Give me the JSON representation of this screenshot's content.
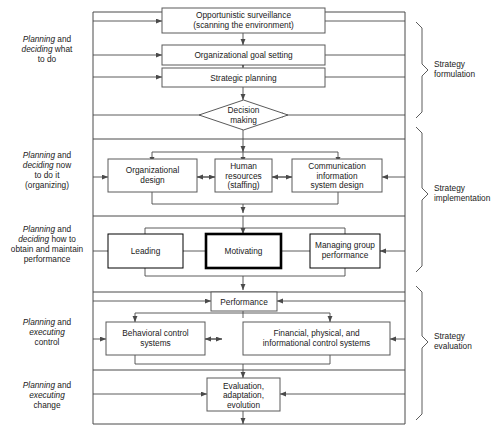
{
  "figure": {
    "background_color": "#ffffff",
    "line_color": "#4a4a4a",
    "box_fill": "#ffffff",
    "emphasis_box": "Motivating"
  },
  "stages": [
    {
      "id": "planning-deciding-what",
      "lines": [
        "Planning and",
        "deciding what",
        "to do"
      ],
      "italic_words": [
        "Planning",
        "deciding"
      ]
    },
    {
      "id": "planning-deciding-now",
      "lines": [
        "Planning and",
        "deciding now",
        "to do it",
        "(organizing)"
      ],
      "italic_words": [
        "Planning",
        "deciding"
      ]
    },
    {
      "id": "planning-deciding-how",
      "lines": [
        "Planning and",
        "deciding how to",
        "obtain and maintain",
        "performance"
      ],
      "italic_words": [
        "Planning",
        "deciding"
      ]
    },
    {
      "id": "planning-executing-control",
      "lines": [
        "Planning and",
        "executing",
        "control"
      ],
      "italic_words": [
        "Planning",
        "executing"
      ]
    },
    {
      "id": "planning-executing-change",
      "lines": [
        "Planning and",
        "executing",
        "change"
      ],
      "italic_words": [
        "Planning",
        "executing"
      ]
    }
  ],
  "nodes": {
    "opportunistic": {
      "lines": [
        "Opportunistic surveillance",
        "(scanning the environment)"
      ],
      "shape": "rect"
    },
    "goal_setting": {
      "lines": [
        "Organizational goal setting"
      ],
      "shape": "rect"
    },
    "strategic_planning": {
      "lines": [
        "Strategic planning"
      ],
      "shape": "rect"
    },
    "decision_making": {
      "lines": [
        "Decision",
        "making"
      ],
      "shape": "diamond"
    },
    "org_design": {
      "lines": [
        "Organizational",
        "design"
      ],
      "shape": "rect"
    },
    "human_resources": {
      "lines": [
        "Human",
        "resources",
        "(staffing)"
      ],
      "shape": "rect"
    },
    "comm_info": {
      "lines": [
        "Communication",
        "information",
        "system design"
      ],
      "shape": "rect"
    },
    "leading": {
      "lines": [
        "Leading"
      ],
      "shape": "rect"
    },
    "motivating": {
      "lines": [
        "Motivating"
      ],
      "shape": "rect",
      "emphasis": true
    },
    "managing_group": {
      "lines": [
        "Managing group",
        "performance"
      ],
      "shape": "rect"
    },
    "performance": {
      "lines": [
        "Performance"
      ],
      "shape": "rect"
    },
    "behavioral_control": {
      "lines": [
        "Behavioral control",
        "systems"
      ],
      "shape": "rect"
    },
    "financial_control": {
      "lines": [
        "Financial, physical, and",
        "informational control systems"
      ],
      "shape": "rect"
    },
    "evaluation": {
      "lines": [
        "Evaluation,",
        "adaptation,",
        "evolution"
      ],
      "shape": "rect"
    }
  },
  "brackets": [
    {
      "id": "strategy-formulation",
      "lines": [
        "Strategy",
        "formulation"
      ]
    },
    {
      "id": "strategy-implementation",
      "lines": [
        "Strategy",
        "implementation"
      ]
    },
    {
      "id": "strategy-evaluation",
      "lines": [
        "Strategy",
        "evaluation"
      ]
    }
  ]
}
